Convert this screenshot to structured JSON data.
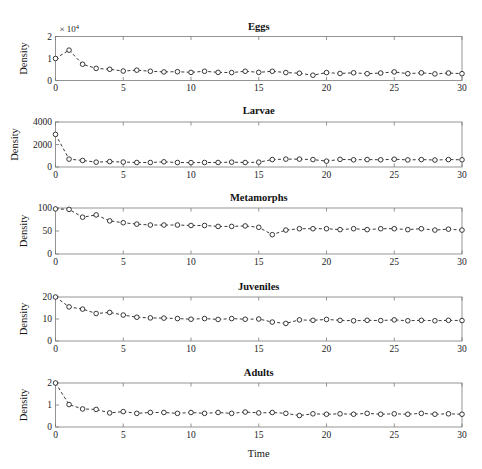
{
  "figure": {
    "xlabel": "Time",
    "ylabel": "Density",
    "exponent_prefix": "× 10",
    "exponent_power": "4"
  },
  "chart_data": [
    {
      "type": "line",
      "title": "Eggs",
      "xlabel": "",
      "ylabel": "Density",
      "xlim": [
        0,
        30
      ],
      "ylim": [
        0,
        20000
      ],
      "xticks": [
        0,
        5,
        10,
        15,
        20,
        25,
        30
      ],
      "yticks": [
        0,
        10000,
        20000
      ],
      "ytick_labels": [
        "0",
        "1",
        "2"
      ],
      "y_exponent": "× 10⁴",
      "grid": false,
      "legend": "none",
      "x": [
        0,
        1,
        2,
        3,
        4,
        5,
        6,
        7,
        8,
        9,
        10,
        11,
        12,
        13,
        14,
        15,
        16,
        17,
        18,
        19,
        20,
        21,
        22,
        23,
        24,
        25,
        26,
        27,
        28,
        29,
        30
      ],
      "values": [
        10000,
        13800,
        7400,
        5500,
        5100,
        4300,
        4700,
        4200,
        3900,
        4000,
        3700,
        4200,
        3700,
        3600,
        4200,
        3700,
        4200,
        3600,
        3300,
        2400,
        3600,
        3200,
        3500,
        3100,
        3400,
        3900,
        3100,
        3500,
        3000,
        3400,
        3100
      ]
    },
    {
      "type": "line",
      "title": "Larvae",
      "xlabel": "",
      "ylabel": "Density",
      "xlim": [
        0,
        30
      ],
      "ylim": [
        0,
        4000
      ],
      "xticks": [
        0,
        5,
        10,
        15,
        20,
        25,
        30
      ],
      "yticks": [
        0,
        2000,
        4000
      ],
      "ytick_labels": [
        "0",
        "2000",
        "4000"
      ],
      "grid": false,
      "legend": "none",
      "x": [
        0,
        1,
        2,
        3,
        4,
        5,
        6,
        7,
        8,
        9,
        10,
        11,
        12,
        13,
        14,
        15,
        16,
        17,
        18,
        19,
        20,
        21,
        22,
        23,
        24,
        25,
        26,
        27,
        28,
        29,
        30
      ],
      "values": [
        2900,
        700,
        580,
        430,
        480,
        440,
        400,
        400,
        460,
        400,
        390,
        400,
        400,
        430,
        400,
        430,
        660,
        700,
        700,
        660,
        520,
        680,
        640,
        660,
        640,
        690,
        630,
        660,
        620,
        660,
        640
      ]
    },
    {
      "type": "line",
      "title": "Metamorphs",
      "xlabel": "",
      "ylabel": "Density",
      "xlim": [
        0,
        30
      ],
      "ylim": [
        0,
        100
      ],
      "xticks": [
        0,
        5,
        10,
        15,
        20,
        25,
        30
      ],
      "yticks": [
        0,
        50,
        100
      ],
      "ytick_labels": [
        "0",
        "50",
        "100"
      ],
      "grid": false,
      "legend": "none",
      "x": [
        0,
        1,
        2,
        3,
        4,
        5,
        6,
        7,
        8,
        9,
        10,
        11,
        12,
        13,
        14,
        15,
        16,
        17,
        18,
        19,
        20,
        21,
        22,
        23,
        24,
        25,
        26,
        27,
        28,
        29,
        30
      ],
      "values": [
        98,
        97,
        80,
        85,
        72,
        68,
        65,
        63,
        63,
        63,
        62,
        62,
        60,
        60,
        61,
        58,
        42,
        52,
        55,
        55,
        55,
        53,
        55,
        53,
        55,
        55,
        53,
        55,
        52,
        54,
        52
      ]
    },
    {
      "type": "line",
      "title": "Juveniles",
      "xlabel": "",
      "ylabel": "Density",
      "xlim": [
        0,
        30
      ],
      "ylim": [
        0,
        20
      ],
      "xticks": [
        0,
        5,
        10,
        15,
        20,
        25,
        30
      ],
      "yticks": [
        0,
        10,
        20
      ],
      "ytick_labels": [
        "0",
        "10",
        "20"
      ],
      "grid": false,
      "legend": "none",
      "x": [
        0,
        1,
        2,
        3,
        4,
        5,
        6,
        7,
        8,
        9,
        10,
        11,
        12,
        13,
        14,
        15,
        16,
        17,
        18,
        19,
        20,
        21,
        22,
        23,
        24,
        25,
        26,
        27,
        28,
        29,
        30
      ],
      "values": [
        20,
        15.5,
        14.5,
        12.5,
        13,
        11.8,
        10.8,
        10.5,
        10.4,
        10.2,
        9.9,
        10.2,
        9.8,
        10.2,
        9.9,
        10,
        8.6,
        8,
        9.6,
        9.4,
        9.8,
        9.4,
        9.2,
        9.4,
        9.3,
        9.6,
        9.2,
        9.4,
        9.2,
        9.4,
        9.3
      ]
    },
    {
      "type": "line",
      "title": "Adults",
      "xlabel": "Time",
      "ylabel": "Density",
      "xlim": [
        0,
        30
      ],
      "ylim": [
        0,
        2
      ],
      "xticks": [
        0,
        5,
        10,
        15,
        20,
        25,
        30
      ],
      "yticks": [
        0,
        1,
        2
      ],
      "ytick_labels": [
        "0",
        "1",
        "2"
      ],
      "grid": false,
      "legend": "none",
      "x": [
        0,
        1,
        2,
        3,
        4,
        5,
        6,
        7,
        8,
        9,
        10,
        11,
        12,
        13,
        14,
        15,
        16,
        17,
        18,
        19,
        20,
        21,
        22,
        23,
        24,
        25,
        26,
        27,
        28,
        29,
        30
      ],
      "values": [
        2.0,
        1.02,
        0.82,
        0.8,
        0.64,
        0.7,
        0.62,
        0.66,
        0.66,
        0.62,
        0.66,
        0.62,
        0.66,
        0.62,
        0.68,
        0.64,
        0.66,
        0.62,
        0.52,
        0.6,
        0.58,
        0.6,
        0.58,
        0.62,
        0.58,
        0.6,
        0.58,
        0.62,
        0.58,
        0.6,
        0.58
      ]
    }
  ]
}
